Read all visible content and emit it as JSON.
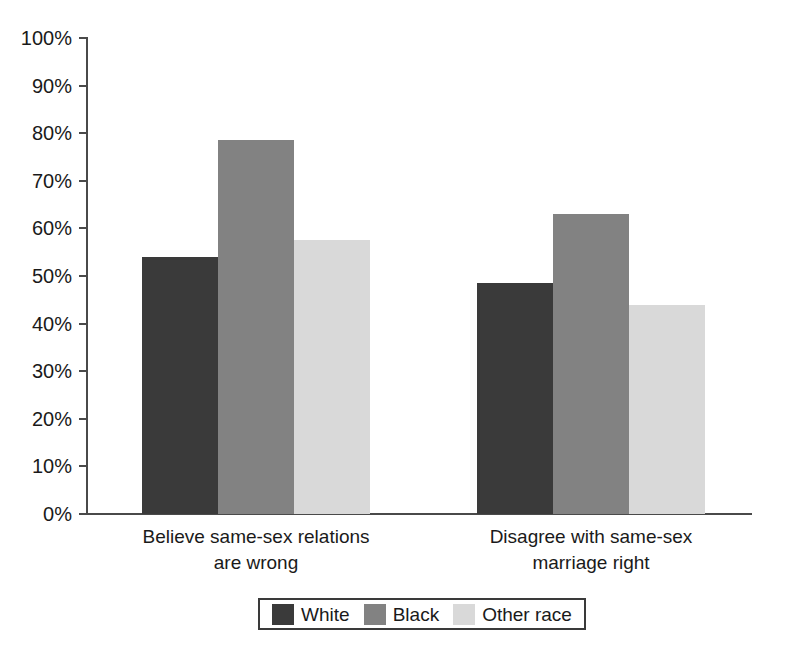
{
  "chart_data": {
    "type": "bar",
    "title": "",
    "subtitle": "",
    "xlabel": "",
    "ylabel": "",
    "ylim": [
      0,
      100
    ],
    "grid": false,
    "legend_position": "bottom",
    "categories": [
      "Believe same-sex relations are wrong",
      "Disagree with same-sex marriage right"
    ],
    "category_lines": [
      [
        "Believe same-sex relations",
        "are wrong"
      ],
      [
        "Disagree with same-sex",
        "marriage right"
      ]
    ],
    "series": [
      {
        "name": "White",
        "color": "#3a3a3a",
        "values": [
          54.0,
          48.5
        ]
      },
      {
        "name": "Black",
        "color": "#828282",
        "values": [
          78.5,
          63.0
        ]
      },
      {
        "name": "Other race",
        "color": "#d9d9d9",
        "values": [
          57.5,
          44.0
        ]
      }
    ],
    "ytick_values": [
      0,
      10,
      20,
      30,
      40,
      50,
      60,
      70,
      80,
      90,
      100
    ],
    "ytick_labels": [
      "0%",
      "10%",
      "20%",
      "30%",
      "40%",
      "50%",
      "60%",
      "70%",
      "80%",
      "90%",
      "100%"
    ]
  },
  "legend": {
    "items": [
      {
        "label": "White",
        "color": "#3a3a3a"
      },
      {
        "label": "Black",
        "color": "#828282"
      },
      {
        "label": "Other race",
        "color": "#d9d9d9"
      }
    ]
  },
  "colors": {
    "axis": "#4a4a4a",
    "text": "#1a1a1a",
    "background": "#ffffff",
    "series_white": "#3a3a3a",
    "series_black": "#828282",
    "series_other": "#d9d9d9"
  }
}
